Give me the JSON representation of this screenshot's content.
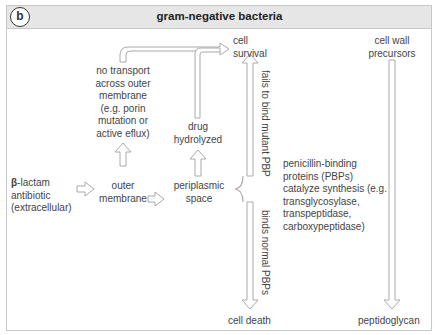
{
  "header": {
    "panel_label": "b",
    "title": "gram-negative bacteria"
  },
  "nodes": {
    "beta_symbol": "β",
    "beta_lactam_rest": "-lactam",
    "antibiotic": "antibiotic",
    "extracellular": "(extracellular)",
    "outer_membrane_1": "outer",
    "outer_membrane_2": "membrane",
    "periplasmic_1": "periplasmic",
    "periplasmic_2": "space",
    "no_transport": [
      "no transport",
      "across outer",
      "membrane",
      "(e.g. porin",
      "mutation or",
      "active eflux)"
    ],
    "drug_hydrolyzed_1": "drug",
    "drug_hydrolyzed_2": "hydrolyzed",
    "cell_survival_1": "cell",
    "cell_survival_2": "survival",
    "cell_death": "cell death",
    "cell_wall_1": "cell wall",
    "cell_wall_2": "precursors",
    "pbp_text": [
      "penicillin-binding",
      "proteins (PBPs)",
      "catalyze synthesis (e.g.",
      "transglycosylase,",
      "transpeptidase,",
      "carboxypeptidase)"
    ],
    "peptidoglycan": "peptidoglycan"
  },
  "edge_labels": {
    "fails_to_bind": "fails to bind mutant PBP",
    "binds_normal": "binds normal PBPs"
  },
  "colors": {
    "arrow_stroke": "#aaaaaa",
    "header_bg": "#e6e6e6",
    "text": "#444444"
  }
}
